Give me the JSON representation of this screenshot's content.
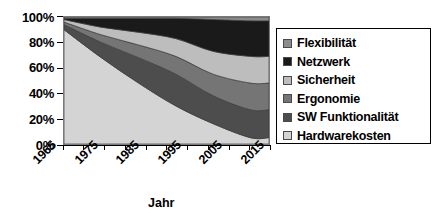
{
  "chart_data": {
    "type": "area",
    "stacked": true,
    "normalized": true,
    "title": "",
    "xlabel": "Jahr",
    "ylabel": "",
    "x": [
      1965,
      1975,
      1985,
      1995,
      2005,
      2015
    ],
    "xlim": [
      1965,
      2020
    ],
    "ylim": [
      0,
      100
    ],
    "ytick_labels": [
      "100%",
      "80%",
      "60%",
      "40%",
      "20%",
      "0%"
    ],
    "ytick_values": [
      100,
      80,
      60,
      40,
      20,
      0
    ],
    "xtick_labels": [
      "1965",
      "1975",
      "1985",
      "1995",
      "2005",
      "2015"
    ],
    "minor_tick_count": 11,
    "grid": false,
    "legend_position": "right",
    "series": [
      {
        "name": "Hardwarekosten",
        "color": "#d4d4d4",
        "values": [
          90,
          68,
          48,
          30,
          16,
          5
        ]
      },
      {
        "name": "SW Funktionalität",
        "color": "#4d4d4d",
        "values": [
          4,
          12,
          20,
          25,
          22,
          22
        ]
      },
      {
        "name": "Ergonomie",
        "color": "#757575",
        "values": [
          2,
          6,
          10,
          14,
          17,
          21
        ]
      },
      {
        "name": "Sicherheit",
        "color": "#bdbdbd",
        "values": [
          2,
          6,
          10,
          14,
          18,
          21
        ]
      },
      {
        "name": "Netzwerk",
        "color": "#1a1a1a",
        "values": [
          1,
          7,
          11,
          16,
          25,
          28
        ]
      },
      {
        "name": "Flexibilität",
        "color": "#8c8c8c",
        "values": [
          1,
          1,
          1,
          1,
          2,
          3
        ]
      }
    ],
    "legend_entries": [
      {
        "label": "Flexibilität",
        "color": "#8c8c8c"
      },
      {
        "label": "Netzwerk",
        "color": "#1a1a1a"
      },
      {
        "label": "Sicherheit",
        "color": "#bdbdbd"
      },
      {
        "label": "Ergonomie",
        "color": "#757575"
      },
      {
        "label": "SW Funktionalität",
        "color": "#4d4d4d"
      },
      {
        "label": "Hardwarekosten",
        "color": "#d4d4d4"
      }
    ]
  }
}
